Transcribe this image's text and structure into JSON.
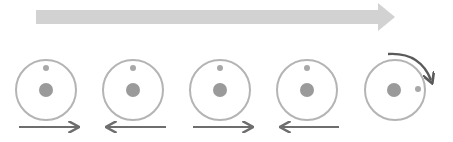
{
  "colors": {
    "background": "#ffffff",
    "progress_arrow": "#d2d2d2",
    "circle_outline": "#b4b4b4",
    "center_dot": "#9a9a9a",
    "small_dot": "#a8a8a8",
    "motion_arrow": "#6e6e6e",
    "rotation_arrow": "#5a5a5a"
  },
  "diagram": {
    "progress_arrow": {
      "direction": "right",
      "icon": "arrow-right-icon"
    },
    "stages": [
      {
        "index": 1,
        "motion": "right",
        "small_dot_position": "top",
        "icon": "arrow-right-icon"
      },
      {
        "index": 2,
        "motion": "left",
        "small_dot_position": "top",
        "icon": "arrow-left-icon"
      },
      {
        "index": 3,
        "motion": "right",
        "small_dot_position": "top",
        "icon": "arrow-right-icon"
      },
      {
        "index": 4,
        "motion": "left",
        "small_dot_position": "top",
        "icon": "arrow-left-icon"
      },
      {
        "index": 5,
        "motion": "rotate-clockwise",
        "small_dot_position": "right",
        "icon": "rotate-clockwise-icon"
      }
    ]
  }
}
